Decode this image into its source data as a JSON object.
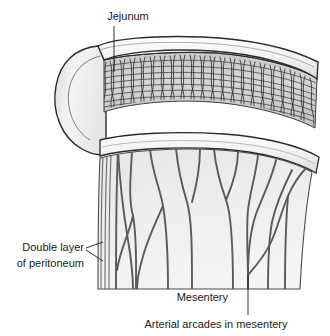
{
  "figure": {
    "background_color": "#ffffff",
    "width": 330,
    "height": 336
  },
  "labels": [
    {
      "id": "jejunum",
      "text": "Jejunum",
      "x": 128,
      "y": 17,
      "anchor": "middle",
      "leader": "M114,26 L114,72"
    },
    {
      "id": "double-layer-of-peritoneum",
      "text_line_1": "Double layer",
      "text_line_2": "of peritoneum",
      "x": 84,
      "y_line_1": 248,
      "y_line_2": 264,
      "anchor": "end",
      "leader": "M86,248 L103,242 M86,250 L103,261"
    },
    {
      "id": "mesentery",
      "text": "Mesentery",
      "x": 228,
      "y": 298,
      "anchor": "end",
      "leader": ""
    },
    {
      "id": "arterial-arcades-in-mesentery",
      "text": "Arterial arcades in mesentery",
      "x": 216,
      "y": 325,
      "anchor": "middle",
      "leader": "M248,315 L248,275"
    }
  ],
  "colors": {
    "outline": "#2b2b2b",
    "vessel": "#555555",
    "mesentery_fill": "#ececec",
    "wall_fill": "#f2f2f2",
    "wall_shadow": "#d8d8d8",
    "villi_line": "#3a3a3a",
    "lumen_fill": "#b9b9b9",
    "text": "#1a1a1a"
  },
  "anatomy": {
    "intestine": {
      "name": "jejunum",
      "description": "cut-open segment of small intestine showing plicae circulares and villi",
      "outer_wall_path": "M96,48 C110,40 150,36 200,38 C245,40 285,48 312,62 L316,75 C300,63 258,53 214,50 C170,47 124,51 104,58 Z",
      "mucosa_path": "M104,62 C130,56 176,53 216,55 C256,58 296,68 316,80 L314,126 C292,114 252,103 212,100 C170,97 126,102 104,110 Z",
      "left_cap_path": "M96,48 C78,50 62,62 58,84 C53,108 62,134 80,146 C90,152 98,154 104,152 L104,58 Z",
      "lumen_edge_path": "M104,58 C130,52 176,49 216,51 C256,54 296,64 316,76",
      "bottom_wall_path": "M100,142 C128,136 178,134 224,137 C266,140 300,148 318,158 L316,172 C296,160 262,151 222,148 C176,145 126,148 100,154 Z"
    },
    "villi_count": 96,
    "mesentery": {
      "name": "mesentery",
      "description": "fan-shaped peritoneal fold suspending the jejunum, cut at lower margin",
      "outline_path": "M100,158 C98,200 98,250 98,289 L300,289 C302,250 306,205 312,172 C292,161 260,153 220,150 C176,147 126,151 100,158 Z",
      "peritoneum_lines": [
        "M103,156 C101,200 101,250 101,289",
        "M107,156 C105,200 105,250 105,289",
        "M111,156 C109,200 109,250 109,289"
      ]
    },
    "vessels": {
      "name": "arterial arcades",
      "description": "branching mesenteric arteries forming arcades, arising from the mesenteric root and running to the intestinal border",
      "branches": [
        "M118,151 C116,190 116,240 116,289",
        "M132,150 C131,175 128,196 133,216 C137,238 136,262 136,289",
        "M133,216 C129,234 120,250 117,270",
        "M150,149 C152,172 160,188 163,206 C167,230 168,260 168,289",
        "M163,206 C155,224 147,240 142,260 C138,274 137,282 137,289",
        "M176,148 C178,170 182,186 187,202 C192,220 192,250 192,289",
        "M200,148 C200,168 197,184 192,202",
        "M214,149 C216,170 221,186 226,200 C232,216 233,250 233,289",
        "M238,151 C238,168 233,184 226,200",
        "M258,155 C256,174 250,192 248,210 C246,232 248,260 248,275 C248,282 248,286 248,289",
        "M276,160 C272,178 262,198 256,214 C250,232 248,258 248,275",
        "M248,275 C256,266 266,254 272,240 C278,226 282,210 288,196 C294,182 302,172 308,166",
        "M292,170 C284,186 276,204 272,222 C268,244 268,268 268,289",
        "M288,196 C286,220 285,256 285,289",
        "M118,151 C120,186 124,216 128,240 C132,264 133,280 133,289"
      ]
    }
  }
}
